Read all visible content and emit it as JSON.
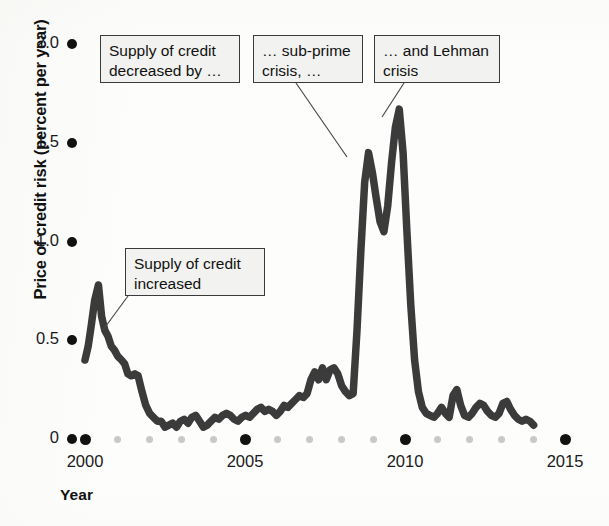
{
  "chart_data": {
    "type": "line",
    "title": "",
    "xlabel": "Year",
    "ylabel": "Price of credit risk (percent per year)",
    "xlim": [
      1999.6,
      2015.2
    ],
    "ylim": [
      0,
      2.0
    ],
    "grid": false,
    "legend": null,
    "y_ticks": [
      {
        "value": 2.0,
        "label": "2.0"
      },
      {
        "value": 1.5,
        "label": "1.5"
      },
      {
        "value": 1.0,
        "label": "1.0"
      },
      {
        "value": 0.5,
        "label": "0.5"
      },
      {
        "value": 0.0,
        "label": "0"
      }
    ],
    "x_major_ticks": [
      {
        "value": 2000,
        "label": "2000"
      },
      {
        "value": 2005,
        "label": "2005"
      },
      {
        "value": 2010,
        "label": "2010"
      },
      {
        "value": 2015,
        "label": "2015"
      }
    ],
    "x_minor_ticks": [
      2001,
      2002,
      2003,
      2004,
      2006,
      2007,
      2008,
      2009,
      2011,
      2012,
      2013,
      2014
    ],
    "series": [
      {
        "name": "Price of credit risk",
        "color": "#3b3b3b",
        "x": [
          2000.0,
          2000.1,
          2000.2,
          2000.3,
          2000.42,
          2000.52,
          2000.62,
          2000.72,
          2000.82,
          2000.92,
          2001.02,
          2001.14,
          2001.24,
          2001.34,
          2001.44,
          2001.56,
          2001.66,
          2001.78,
          2001.9,
          2002.02,
          2002.14,
          2002.26,
          2002.38,
          2002.5,
          2002.62,
          2002.74,
          2002.86,
          2002.98,
          2003.1,
          2003.22,
          2003.34,
          2003.46,
          2003.58,
          2003.7,
          2003.82,
          2003.94,
          2004.06,
          2004.18,
          2004.3,
          2004.42,
          2004.54,
          2004.66,
          2004.78,
          2004.9,
          2005.02,
          2005.14,
          2005.26,
          2005.38,
          2005.5,
          2005.62,
          2005.74,
          2005.86,
          2005.98,
          2006.1,
          2006.22,
          2006.34,
          2006.46,
          2006.58,
          2006.7,
          2006.82,
          2006.94,
          2007.06,
          2007.18,
          2007.3,
          2007.42,
          2007.54,
          2007.66,
          2007.78,
          2007.9,
          2008.02,
          2008.14,
          2008.26,
          2008.38,
          2008.5,
          2008.62,
          2008.74,
          2008.86,
          2008.98,
          2009.1,
          2009.22,
          2009.34,
          2009.46,
          2009.58,
          2009.7,
          2009.82,
          2009.94,
          2010.06,
          2010.18,
          2010.3,
          2010.42,
          2010.54,
          2010.66,
          2010.78,
          2010.9,
          2011.02,
          2011.14,
          2011.26,
          2011.38,
          2011.5,
          2011.62,
          2011.74,
          2011.86,
          2011.98,
          2012.1,
          2012.22,
          2012.34,
          2012.46,
          2012.58,
          2012.7,
          2012.82,
          2012.94,
          2013.06,
          2013.18,
          2013.3,
          2013.42,
          2013.54,
          2013.66,
          2013.78,
          2013.9,
          2014.02
        ],
        "y": [
          0.4,
          0.47,
          0.58,
          0.7,
          0.78,
          0.62,
          0.55,
          0.52,
          0.47,
          0.45,
          0.42,
          0.4,
          0.38,
          0.33,
          0.32,
          0.33,
          0.32,
          0.24,
          0.17,
          0.13,
          0.11,
          0.09,
          0.09,
          0.06,
          0.07,
          0.08,
          0.06,
          0.09,
          0.1,
          0.08,
          0.11,
          0.12,
          0.09,
          0.06,
          0.07,
          0.09,
          0.11,
          0.1,
          0.12,
          0.13,
          0.12,
          0.1,
          0.09,
          0.11,
          0.12,
          0.11,
          0.13,
          0.15,
          0.16,
          0.14,
          0.15,
          0.14,
          0.12,
          0.14,
          0.17,
          0.16,
          0.18,
          0.2,
          0.22,
          0.21,
          0.23,
          0.3,
          0.34,
          0.3,
          0.36,
          0.3,
          0.35,
          0.36,
          0.33,
          0.27,
          0.24,
          0.22,
          0.23,
          0.55,
          0.95,
          1.3,
          1.45,
          1.35,
          1.22,
          1.1,
          1.05,
          1.18,
          1.4,
          1.58,
          1.67,
          1.45,
          1.05,
          0.68,
          0.4,
          0.24,
          0.16,
          0.13,
          0.12,
          0.11,
          0.13,
          0.16,
          0.13,
          0.11,
          0.22,
          0.25,
          0.17,
          0.12,
          0.11,
          0.13,
          0.16,
          0.18,
          0.17,
          0.14,
          0.12,
          0.11,
          0.13,
          0.18,
          0.19,
          0.15,
          0.12,
          0.1,
          0.09,
          0.1,
          0.09,
          0.07
        ]
      }
    ],
    "annotations": [
      {
        "id": "supply-decreased",
        "text": "Supply of credit\ndecreased by …",
        "box": {
          "left": 100,
          "top": 35,
          "width": 140,
          "height": 48
        },
        "leader": null
      },
      {
        "id": "subprime-crisis",
        "text": "… sub-prime\ncrisis, …",
        "box": {
          "left": 253,
          "top": 35,
          "width": 110,
          "height": 48
        },
        "leader": {
          "x1": 296,
          "y1": 83,
          "x2": 347,
          "y2": 157
        }
      },
      {
        "id": "lehman-crisis",
        "text": "… and Lehman\ncrisis",
        "box": {
          "left": 374,
          "top": 35,
          "width": 126,
          "height": 48
        },
        "leader": {
          "x1": 404,
          "y1": 83,
          "x2": 382,
          "y2": 117
        }
      },
      {
        "id": "supply-increased",
        "text": "Supply of credit\nincreased",
        "box": {
          "left": 125,
          "top": 248,
          "width": 140,
          "height": 48
        },
        "leader": {
          "x1": 128,
          "y1": 296,
          "x2": 103,
          "y2": 330
        }
      }
    ]
  },
  "axes": {
    "y_axis_title": "Price of credit risk (percent per year)",
    "x_axis_title": "Year"
  }
}
